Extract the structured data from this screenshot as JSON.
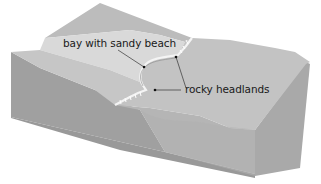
{
  "diagram": {
    "type": "block-diagram",
    "labels": {
      "bay": "bay with sandy beach",
      "headlands": "rocky headlands"
    },
    "colors": {
      "land_top": "#b9b9b9",
      "beach_band": "#d6d6d6",
      "land_slope": "#c4c4c4",
      "sea_surface": "#c2c2c2",
      "block_left_face": "#9e9e9e",
      "block_front_face_sea": "#b3b3b3",
      "block_right_face": "#a8a8a8",
      "coastline": "#f2f2f2",
      "leader_line": "#333333"
    }
  }
}
